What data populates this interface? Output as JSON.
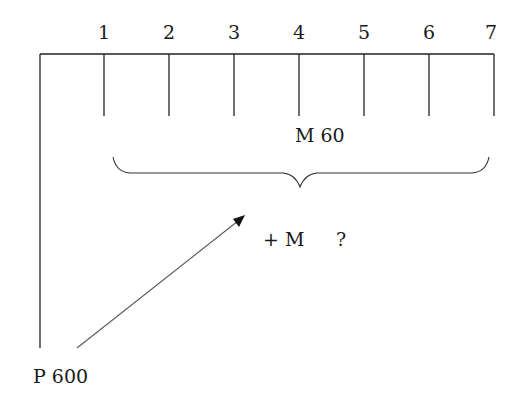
{
  "diagram": {
    "type": "timeline-annuity",
    "periods": [
      "1",
      "2",
      "3",
      "4",
      "5",
      "6",
      "7"
    ],
    "payment_label": "M 60",
    "added_payment_label": "+ M",
    "unknown_label": "?",
    "present_value_label": "P 600",
    "colors": {
      "line": "#222222",
      "text": "#1a1a1a",
      "arrow": "#555555"
    }
  }
}
